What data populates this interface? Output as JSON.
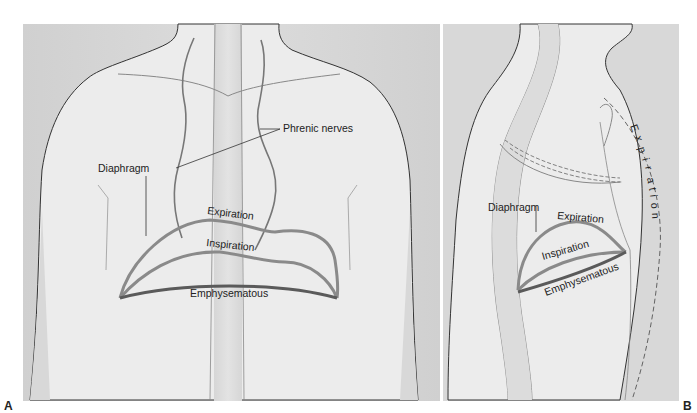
{
  "figure": {
    "panels": [
      {
        "id": "A",
        "view": "anterior",
        "labels": {
          "phrenic_nerves": "Phrenic nerves",
          "diaphragm": "Diaphragm",
          "expiration": "Expiration",
          "inspiration": "Inspiration",
          "emphysematous": "Emphysematous"
        },
        "letter": "A"
      },
      {
        "id": "B",
        "view": "lateral",
        "labels": {
          "expiration_vertical": [
            "E",
            "x",
            "p",
            "i",
            "r",
            "a",
            "t",
            "i",
            "o",
            "n"
          ],
          "diaphragm": "Diaphragm",
          "expiration": "Expiration",
          "inspiration": "Inspiration",
          "emphysematous": "Emphysematous"
        },
        "letter": "B"
      }
    ],
    "colors": {
      "background": "#d9d9d9",
      "body_fill": "#ececec",
      "body_outline": "#333333",
      "diaphragm_stroke": "#8a8a8a",
      "emphysematous_stroke": "#5a5a5a",
      "nerve_stroke": "#777777"
    }
  }
}
